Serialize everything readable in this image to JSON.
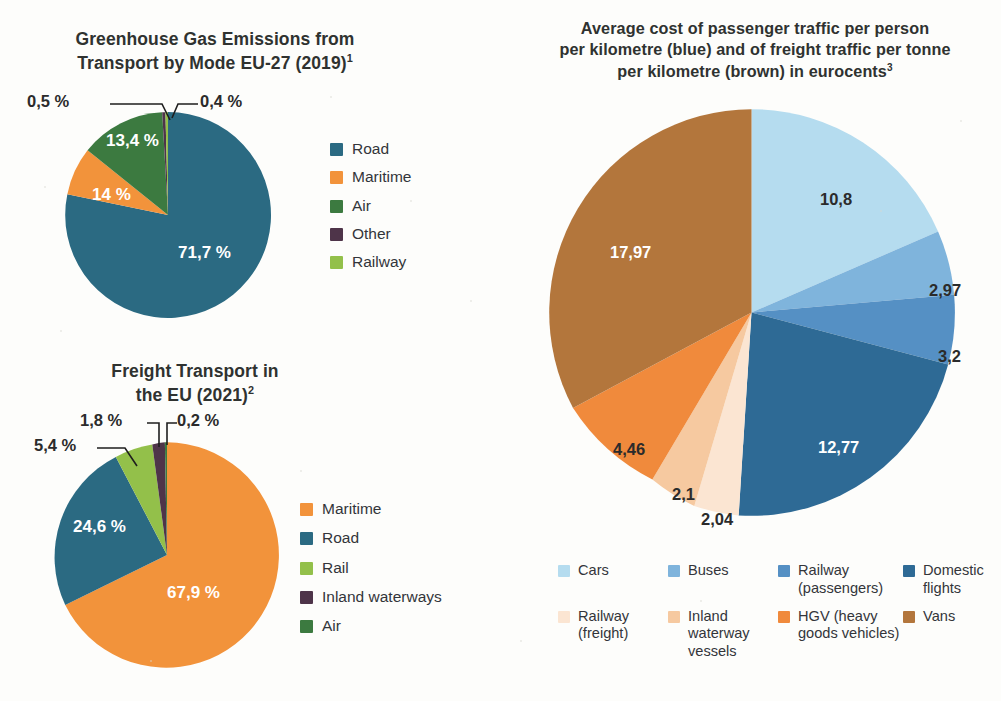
{
  "page": {
    "background": "#fdfdfb",
    "width": 1001,
    "height": 701
  },
  "charts": {
    "ghg": {
      "title_line1": "Greenhouse Gas Emissions from",
      "title_line2": "Transport by Mode EU-27 (2019)",
      "title_superscript": "1"
    },
    "freight": {
      "title_line1": "Freight Transport in",
      "title_line2": "the EU (2021)",
      "title_superscript": "2"
    },
    "cost": {
      "title_line1": "Average cost of passenger traffic per person",
      "title_line2": "per kilometre (blue) and of freight traffic per tonne",
      "title_line3": "per kilometre (brown) in eurocents",
      "title_superscript": "3"
    }
  },
  "chart_data": [
    {
      "id": "ghg-emissions",
      "type": "pie",
      "title": "Greenhouse Gas Emissions from Transport by Mode EU-27 (2019)",
      "unit": "%",
      "value_format": "comma-decimal",
      "legend_position": "right",
      "categories": [
        "Road",
        "Maritime",
        "Air",
        "Other",
        "Railway"
      ],
      "values": [
        71.7,
        14,
        13.4,
        0.5,
        0.4
      ],
      "labels": [
        "71,7 %",
        "14 %",
        "13,4 %",
        "0,5 %",
        "0,4 %"
      ],
      "colors": [
        "#2b6a82",
        "#f2933b",
        "#3c7a40",
        "#4e3449",
        "#93c04a"
      ],
      "label_placement": [
        "inside",
        "inside",
        "inside",
        "callout",
        "callout"
      ]
    },
    {
      "id": "freight-transport",
      "type": "pie",
      "title": "Freight Transport in the EU (2021)",
      "unit": "%",
      "value_format": "comma-decimal",
      "legend_position": "right",
      "categories": [
        "Maritime",
        "Road",
        "Rail",
        "Inland waterways",
        "Air"
      ],
      "values": [
        67.9,
        24.6,
        5.4,
        1.8,
        0.2
      ],
      "labels": [
        "67,9 %",
        "24,6 %",
        "5,4 %",
        "1,8 %",
        "0,2 %"
      ],
      "colors": [
        "#f2933b",
        "#2b6a82",
        "#93c04a",
        "#4e3449",
        "#3c7a40"
      ],
      "label_placement": [
        "inside",
        "inside",
        "callout",
        "callout",
        "callout"
      ]
    },
    {
      "id": "average-cost",
      "type": "pie",
      "title": "Average cost of passenger traffic per person per kilometre (blue) and of freight traffic per tonne per kilometre (brown) in eurocents",
      "unit": "eurocents",
      "value_format": "comma-decimal",
      "legend_position": "bottom",
      "categories": [
        "Cars",
        "Buses",
        "Railway (passengers)",
        "Domestic flights",
        "Railway (freight)",
        "Inland waterway vessels",
        "HGV (heavy goods vehicles)",
        "Vans"
      ],
      "values": [
        10.8,
        2.97,
        3.2,
        12.77,
        2.04,
        2.1,
        4.46,
        17.97
      ],
      "labels": [
        "10,8",
        "2,97",
        "3,2",
        "12,77",
        "2,04",
        "2,1",
        "4,46",
        "17,97"
      ],
      "colors": [
        "#b5dcef",
        "#7fb4dc",
        "#5590c4",
        "#2e6a95",
        "#fbe5d2",
        "#f6c9a0",
        "#f08a3c",
        "#b3763c"
      ],
      "label_placement": [
        "inside",
        "inside",
        "inside",
        "inside",
        "inside",
        "inside",
        "inside",
        "inside"
      ]
    }
  ],
  "legends": {
    "ghg": [
      {
        "label": "Road",
        "color": "#2b6a82"
      },
      {
        "label": "Maritime",
        "color": "#f2933b"
      },
      {
        "label": "Air",
        "color": "#3c7a40"
      },
      {
        "label": "Other",
        "color": "#4e3449"
      },
      {
        "label": "Railway",
        "color": "#93c04a"
      }
    ],
    "freight": [
      {
        "label": "Maritime",
        "color": "#f2933b"
      },
      {
        "label": "Road",
        "color": "#2b6a82"
      },
      {
        "label": "Rail",
        "color": "#93c04a"
      },
      {
        "label": "Inland waterways",
        "color": "#4e3449"
      },
      {
        "label": "Air",
        "color": "#3c7a40"
      }
    ],
    "cost": [
      {
        "label": "Cars",
        "color": "#b5dcef"
      },
      {
        "label": "Buses",
        "color": "#7fb4dc"
      },
      {
        "label": "Railway (passengers)",
        "color": "#5590c4"
      },
      {
        "label": "Domestic flights",
        "color": "#2e6a95"
      },
      {
        "label": "Railway (freight)",
        "color": "#fbe5d2"
      },
      {
        "label": "Inland waterway vessels",
        "color": "#f6c9a0"
      },
      {
        "label": "HGV (heavy goods vehicles)",
        "color": "#f08a3c"
      },
      {
        "label": "Vans",
        "color": "#b3763c"
      }
    ]
  }
}
